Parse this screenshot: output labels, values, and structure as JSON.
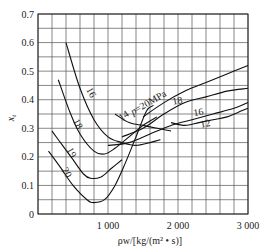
{
  "chart_data": {
    "type": "line",
    "title": "",
    "xlabel": "ρw/[kg/(m² • s)]",
    "ylabel": "x_t",
    "xlim": [
      0,
      3000
    ],
    "ylim": [
      0,
      0.7
    ],
    "grid": true,
    "x_ticks": [
      {
        "value": 1000,
        "label": "1 000"
      },
      {
        "value": 2000,
        "label": "2 000"
      },
      {
        "value": 3000,
        "label": "3 000"
      }
    ],
    "y_ticks": [
      {
        "value": 0,
        "label": "0"
      },
      {
        "value": 0.1,
        "label": "0.1"
      },
      {
        "value": 0.2,
        "label": "0.2"
      },
      {
        "value": 0.3,
        "label": "0.3"
      },
      {
        "value": 0.4,
        "label": "0.4"
      },
      {
        "value": 0.5,
        "label": "0.5"
      },
      {
        "value": 0.6,
        "label": "0.6"
      },
      {
        "value": 0.7,
        "label": "0.7"
      }
    ],
    "series": [
      {
        "name": "16",
        "group": "low-flow",
        "label": "16",
        "points": [
          [
            400,
            0.6
          ],
          [
            600,
            0.44
          ],
          [
            800,
            0.33
          ],
          [
            1000,
            0.27
          ],
          [
            1200,
            0.25
          ],
          [
            1400,
            0.24
          ],
          [
            1600,
            0.25
          ],
          [
            1750,
            0.26
          ]
        ]
      },
      {
        "name": "18",
        "group": "low-flow",
        "label": "18",
        "points": [
          [
            290,
            0.47
          ],
          [
            450,
            0.36
          ],
          [
            600,
            0.28
          ],
          [
            800,
            0.22
          ],
          [
            950,
            0.21
          ],
          [
            1100,
            0.23
          ],
          [
            1300,
            0.27
          ],
          [
            1500,
            0.31
          ],
          [
            1700,
            0.34
          ]
        ]
      },
      {
        "name": "19",
        "group": "low-flow",
        "label": "19",
        "points": [
          [
            200,
            0.29
          ],
          [
            350,
            0.24
          ],
          [
            500,
            0.19
          ],
          [
            650,
            0.14
          ],
          [
            750,
            0.125
          ],
          [
            900,
            0.13
          ],
          [
            1050,
            0.16
          ],
          [
            1200,
            0.19
          ]
        ]
      },
      {
        "name": "20",
        "group": "low-flow",
        "label": "20",
        "points": [
          [
            150,
            0.22
          ],
          [
            300,
            0.17
          ],
          [
            500,
            0.1
          ],
          [
            700,
            0.05
          ],
          [
            800,
            0.04
          ],
          [
            950,
            0.05
          ],
          [
            1100,
            0.1
          ],
          [
            1250,
            0.18
          ],
          [
            1400,
            0.27
          ],
          [
            1550,
            0.36
          ],
          [
            1650,
            0.38
          ]
        ]
      },
      {
        "name": "14",
        "group": "low-flow",
        "label": "14",
        "points": [
          [
            1100,
            0.35
          ],
          [
            1300,
            0.32
          ],
          [
            1500,
            0.31
          ],
          [
            1700,
            0.3
          ],
          [
            1900,
            0.29
          ]
        ]
      },
      {
        "name": "p=20MPa",
        "group": "high-flow",
        "label": "p=20MPa",
        "points": [
          [
            1500,
            0.34
          ],
          [
            1800,
            0.39
          ],
          [
            2100,
            0.43
          ],
          [
            2400,
            0.46
          ],
          [
            2700,
            0.49
          ],
          [
            3000,
            0.52
          ]
        ]
      },
      {
        "name": "18",
        "group": "high-flow",
        "label": "18",
        "points": [
          [
            1200,
            0.27
          ],
          [
            1500,
            0.3
          ],
          [
            1800,
            0.35
          ],
          [
            2100,
            0.39
          ],
          [
            2400,
            0.41
          ],
          [
            2700,
            0.43
          ],
          [
            3000,
            0.44
          ]
        ]
      },
      {
        "name": "16",
        "group": "high-flow",
        "label": "16",
        "points": [
          [
            1000,
            0.24
          ],
          [
            1300,
            0.25
          ],
          [
            1600,
            0.28
          ],
          [
            1900,
            0.31
          ],
          [
            2200,
            0.33
          ],
          [
            2500,
            0.35
          ],
          [
            2800,
            0.37
          ],
          [
            3000,
            0.39
          ]
        ]
      },
      {
        "name": "12",
        "group": "high-flow",
        "label": "12",
        "points": [
          [
            1900,
            0.32
          ],
          [
            2100,
            0.31
          ],
          [
            2300,
            0.32
          ],
          [
            2500,
            0.33
          ],
          [
            2700,
            0.34
          ],
          [
            2900,
            0.36
          ],
          [
            3000,
            0.37
          ]
        ]
      }
    ],
    "annotations": [
      {
        "text": "16",
        "x": 720,
        "y": 0.42,
        "rotate": 62
      },
      {
        "text": "18",
        "x": 530,
        "y": 0.31,
        "rotate": 62
      },
      {
        "text": "19",
        "x": 440,
        "y": 0.21,
        "rotate": 62
      },
      {
        "text": "20",
        "x": 370,
        "y": 0.14,
        "rotate": 62
      },
      {
        "text": "14",
        "x": 1250,
        "y": 0.335,
        "rotate": -35
      },
      {
        "text": "p=20MPa",
        "x": 1600,
        "y": 0.38,
        "rotate": -30
      },
      {
        "text": "18",
        "x": 2000,
        "y": 0.385,
        "rotate": -10
      },
      {
        "text": "16",
        "x": 2300,
        "y": 0.345,
        "rotate": -10
      },
      {
        "text": "12",
        "x": 2400,
        "y": 0.305,
        "rotate": -10
      }
    ]
  }
}
